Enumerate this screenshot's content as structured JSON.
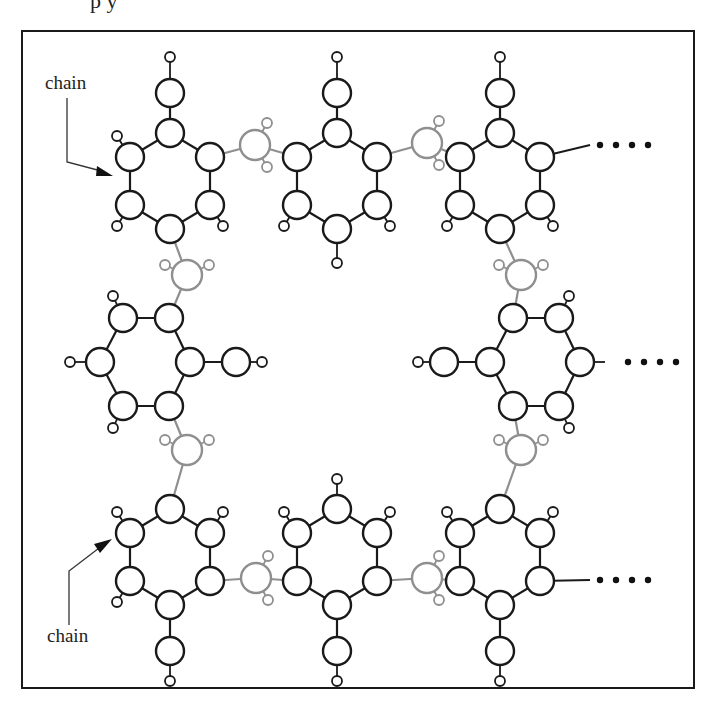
{
  "caption_fragment": "p   y",
  "labels": {
    "chain_top": "chain",
    "chain_bottom": "chain"
  },
  "continuation": "....",
  "colors": {
    "ring_stroke": "#1a1a1a",
    "linker_stroke": "#8f8f8f",
    "atom_fill": "#ffffff",
    "frame_stroke": "#1a1a1a",
    "dot_fill": "#111111"
  },
  "structure": {
    "description": "Square macrocycle of hexagonal rings joined by grey tetrahedral linker atoms",
    "ring_count": 8,
    "linker_count": 8
  }
}
